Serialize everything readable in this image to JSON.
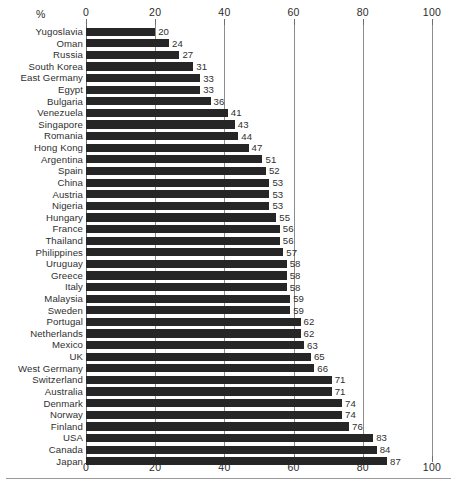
{
  "chart_data": {
    "type": "bar",
    "orientation": "horizontal",
    "title": "",
    "xlabel": "%",
    "ylabel": "",
    "xlim": [
      0,
      100
    ],
    "xticks": [
      0,
      20,
      40,
      60,
      80,
      100
    ],
    "grid": true,
    "legend": null,
    "axis_top": true,
    "axis_bottom": true,
    "value_labels": true,
    "bar_color": "#262626",
    "categories": [
      "Yugoslavia",
      "Oman",
      "Russia",
      "South Korea",
      "East Germany",
      "Egypt",
      "Bulgaria",
      "Venezuela",
      "Singapore",
      "Romania",
      "Hong Kong",
      "Argentina",
      "Spain",
      "China",
      "Austria",
      "Nigeria",
      "Hungary",
      "France",
      "Thailand",
      "Philippines",
      "Uruguay",
      "Greece",
      "Italy",
      "Malaysia",
      "Sweden",
      "Portugal",
      "Netherlands",
      "Mexico",
      "UK",
      "West Germany",
      "Switzerland",
      "Australia",
      "Denmark",
      "Norway",
      "Finland",
      "USA",
      "Canada",
      "Japan"
    ],
    "values": [
      20,
      24,
      27,
      31,
      33,
      33,
      36,
      41,
      43,
      44,
      47,
      51,
      52,
      53,
      53,
      53,
      55,
      56,
      56,
      57,
      58,
      58,
      58,
      59,
      59,
      62,
      62,
      63,
      65,
      66,
      71,
      71,
      74,
      74,
      76,
      83,
      84,
      87
    ]
  },
  "axis": {
    "unit_label": "%",
    "ticks": [
      "0",
      "20",
      "40",
      "60",
      "80",
      "100"
    ]
  },
  "colors": {
    "bar": "#262626",
    "gridline": "#8d8d8d",
    "text": "#2f2f2f",
    "background": "#ffffff"
  }
}
